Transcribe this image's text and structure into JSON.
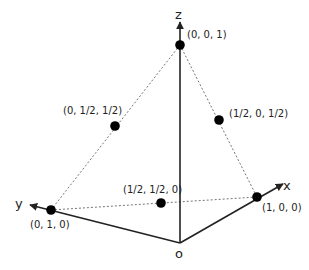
{
  "diagram": {
    "type": "3d-coordinate-simplex",
    "colors": {
      "axis": "#222222",
      "dashed": "#666666",
      "point": "#000000",
      "background": "#ffffff"
    },
    "axes": {
      "x": {
        "label": "x"
      },
      "y": {
        "label": "y"
      },
      "z": {
        "label": "z"
      },
      "origin": {
        "label": "o"
      }
    },
    "points": [
      {
        "id": "z-vertex",
        "label": "(0, 0, 1)"
      },
      {
        "id": "y-vertex",
        "label": "(0, 1, 0)"
      },
      {
        "id": "x-vertex",
        "label": "(1, 0, 0)"
      },
      {
        "id": "yz-mid",
        "label": "(0, 1/2, 1/2)"
      },
      {
        "id": "xz-mid",
        "label": "(1/2, 0, 1/2)"
      },
      {
        "id": "xy-mid",
        "label": "(1/2, 1/2, 0)"
      }
    ]
  }
}
